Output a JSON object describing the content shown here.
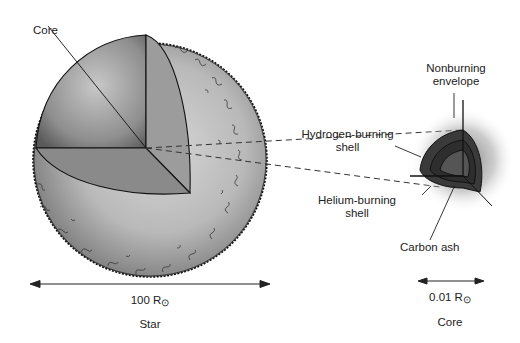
{
  "figure": {
    "type": "star_and_core_cutaway",
    "left_object": {
      "caption": "Star",
      "scale_value": "100 R",
      "scale_unit_symbol": "⊙",
      "labels": {
        "core": "Core"
      }
    },
    "right_object": {
      "caption": "Core",
      "scale_value": "0.01 R",
      "scale_unit_symbol": "⊙",
      "labels": {
        "nonburning_envelope_line1": "Nonburning",
        "nonburning_envelope_line2": "envelope",
        "hydrogen_shell_line1": "Hydrogen-burning",
        "hydrogen_shell_line2": "shell",
        "helium_shell_line1": "Helium-burning",
        "helium_shell_line2": "shell",
        "carbon_ash": "Carbon ash"
      }
    },
    "colors": {
      "star_envelope": "#b8b8b8",
      "star_core": "#8a8a8a",
      "core_shells": "#3a3a3a",
      "outline": "#111111"
    }
  }
}
